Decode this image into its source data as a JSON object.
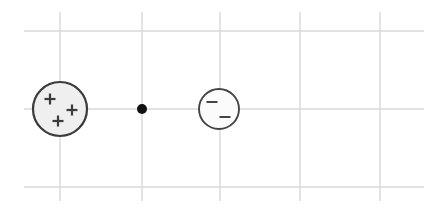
{
  "figure": {
    "width": 441,
    "height": 216,
    "background_color": "#ffffff"
  },
  "grid": {
    "name": "background-grid",
    "line_color": "#d9d9d9",
    "line_width": 1.4,
    "vertical_lines": [
      {
        "x": 60,
        "y1": 12,
        "y2": 201
      },
      {
        "x": 142,
        "y1": 12,
        "y2": 201
      },
      {
        "x": 220,
        "y1": 12,
        "y2": 201
      },
      {
        "x": 300,
        "y1": 12,
        "y2": 201
      },
      {
        "x": 380,
        "y1": 12,
        "y2": 201
      }
    ],
    "horizontal_lines": [
      {
        "y": 31,
        "x1": 24,
        "x2": 424
      },
      {
        "y": 109,
        "x1": 24,
        "x2": 424
      },
      {
        "y": 187,
        "x1": 24,
        "x2": 424
      }
    ]
  },
  "objects": {
    "positive_charge": {
      "label": "positive-charge",
      "sign": "+",
      "charge_count": 3,
      "cx": 60,
      "cy": 109,
      "r": 27,
      "fill_color": "#efefef",
      "stroke_color": "#3b3b3b",
      "stroke_width": 2.2,
      "signs": [
        {
          "cx": 50,
          "cy": 99,
          "size": 11,
          "thickness": 2.2
        },
        {
          "cx": 72,
          "cy": 110,
          "size": 11,
          "thickness": 2.2
        },
        {
          "cx": 58,
          "cy": 121,
          "size": 11,
          "thickness": 2.2
        }
      ]
    },
    "field_point": {
      "label": "field-point",
      "cx": 142,
      "cy": 109,
      "r": 5,
      "fill_color": "#111111"
    },
    "negative_charge": {
      "label": "negative-charge",
      "sign": "−",
      "charge_count": 2,
      "cx": 219,
      "cy": 109,
      "r": 20,
      "fill_color": "#fbfbfb",
      "stroke_color": "#444444",
      "stroke_width": 1.9,
      "signs": [
        {
          "cx": 212,
          "cy": 102,
          "size": 11,
          "thickness": 2.0
        },
        {
          "cx": 225,
          "cy": 117,
          "size": 11,
          "thickness": 2.0
        }
      ]
    }
  }
}
